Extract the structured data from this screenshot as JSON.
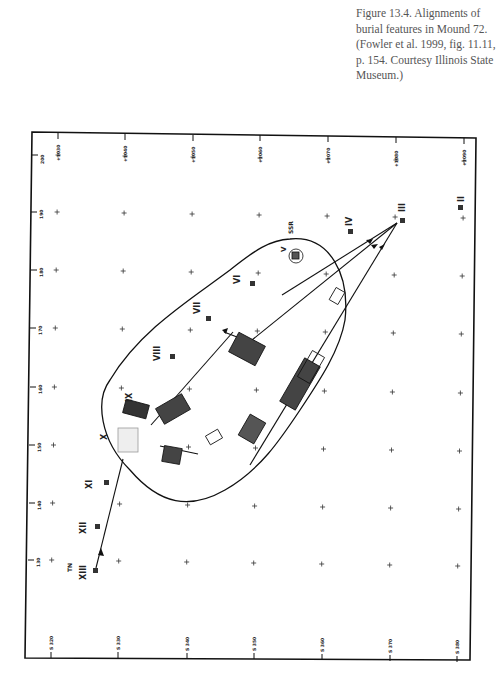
{
  "caption": {
    "text": "Figure 13.4. Alignments of burial features in Mound 72. (Fowler et al. 1999, fig. 11.11, p. 154. Courtesy Illinois State Museum.)"
  },
  "figure": {
    "feature_labels": {
      "II": "II",
      "III": "III",
      "IV": "IV",
      "V": "V",
      "SSR": "SSR",
      "VI": "VI",
      "VII": "VII",
      "VIII": "VIII",
      "IX": "IX",
      "X": "X",
      "XI": "XI",
      "XII": "XII",
      "XIII": "XIII",
      "TN": "TN"
    },
    "left_axis_ticks": [
      "200",
      "190",
      "180",
      "170",
      "160",
      "150",
      "140",
      "130"
    ],
    "top_axis_ticks": [
      "+1030",
      "+1040",
      "+1050",
      "+1060",
      "+1070",
      "+1080",
      "+1090"
    ],
    "bottom_axis_ticks": [
      "S 320",
      "S 330",
      "S 340",
      "S 350",
      "S 360",
      "S 370",
      "S 380"
    ]
  }
}
